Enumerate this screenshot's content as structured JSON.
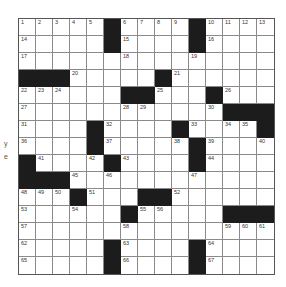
{
  "puzzle": {
    "rows": 15,
    "cols": 15,
    "side_text": [
      "y",
      "e"
    ],
    "grid": [
      [
        "1",
        "2",
        "3",
        "4",
        "5",
        "#",
        "6",
        "7",
        "8",
        "9",
        "#",
        "10",
        "11",
        "12",
        "13"
      ],
      [
        "14",
        "",
        "",
        "",
        "",
        "#",
        "15",
        "",
        "",
        "",
        "#",
        "16",
        "",
        "",
        ""
      ],
      [
        "17",
        "",
        "",
        "",
        "",
        "",
        "18",
        "",
        "",
        "",
        "19",
        "",
        "",
        "",
        ""
      ],
      [
        "#",
        "#",
        "#",
        "20",
        "",
        "",
        "",
        "",
        "#",
        "21",
        "",
        "",
        "",
        "",
        ""
      ],
      [
        "22",
        "23",
        "24",
        "",
        "",
        "",
        "#",
        "#",
        "25",
        "",
        "",
        "#",
        "26",
        "",
        ""
      ],
      [
        "27",
        "",
        "",
        "",
        "",
        "",
        "28",
        "29",
        "",
        "",
        "",
        "30",
        "#",
        "#",
        "#"
      ],
      [
        "31",
        "",
        "",
        "",
        "#",
        "32",
        "",
        "",
        "",
        "#",
        "33",
        "",
        "34",
        "35",
        "#"
      ],
      [
        "36",
        "",
        "",
        "",
        "#",
        "37",
        "",
        "",
        "",
        "38",
        "#",
        "39",
        "",
        "",
        "40"
      ],
      [
        "#",
        "41",
        "",
        "",
        "42",
        "#",
        "43",
        "",
        "",
        "",
        "#",
        "44",
        "",
        "",
        ""
      ],
      [
        "#",
        "#",
        "#",
        "45",
        "",
        "46",
        "",
        "",
        "",
        "",
        "47",
        "",
        "",
        "",
        ""
      ],
      [
        "48",
        "49",
        "50",
        "#",
        "51",
        "",
        "",
        "#",
        "#",
        "52",
        "",
        "",
        "",
        "",
        ""
      ],
      [
        "53",
        "",
        "",
        "54",
        "",
        "",
        "#",
        "55",
        "56",
        "",
        "",
        "",
        "#",
        "#",
        "#"
      ],
      [
        "57",
        "",
        "",
        "",
        "",
        "",
        "58",
        "",
        "",
        "",
        "",
        "",
        "59",
        "60",
        "61"
      ],
      [
        "62",
        "",
        "",
        "",
        "",
        "#",
        "63",
        "",
        "",
        "",
        "#",
        "64",
        "",
        "",
        ""
      ],
      [
        "65",
        "",
        "",
        "",
        "",
        "#",
        "66",
        "",
        "",
        "",
        "#",
        "67",
        "",
        "",
        ""
      ]
    ]
  }
}
